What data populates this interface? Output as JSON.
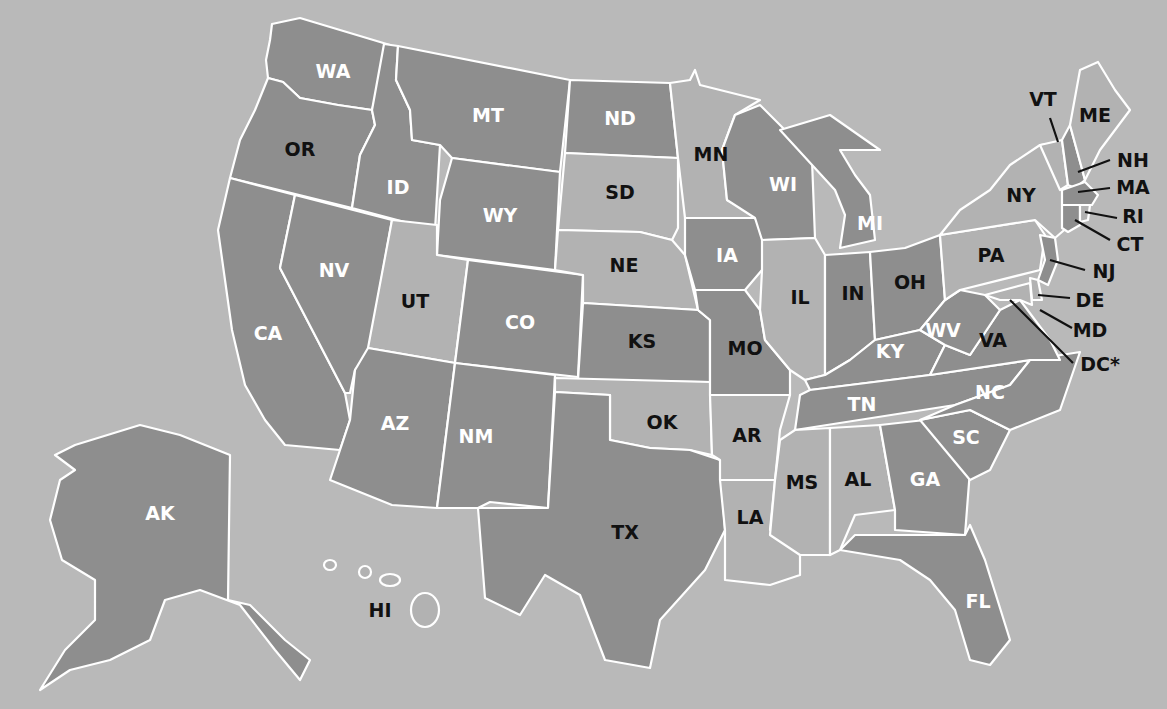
{
  "map": {
    "title": "United States state map",
    "colors": {
      "background": "#b9b9b9",
      "dark_fill": "#8e8e8e",
      "light_fill": "#b2b2b2",
      "border": "#ffffff",
      "label_dark": "#111111",
      "label_light": "#ffffff"
    },
    "states": [
      {
        "abbr": "WA",
        "shade": "dark",
        "label_color": "white"
      },
      {
        "abbr": "OR",
        "shade": "dark",
        "label_color": "black"
      },
      {
        "abbr": "CA",
        "shade": "dark",
        "label_color": "white"
      },
      {
        "abbr": "ID",
        "shade": "dark",
        "label_color": "white"
      },
      {
        "abbr": "NV",
        "shade": "dark",
        "label_color": "white"
      },
      {
        "abbr": "MT",
        "shade": "dark",
        "label_color": "white"
      },
      {
        "abbr": "WY",
        "shade": "dark",
        "label_color": "white"
      },
      {
        "abbr": "UT",
        "shade": "light",
        "label_color": "black"
      },
      {
        "abbr": "CO",
        "shade": "dark",
        "label_color": "white"
      },
      {
        "abbr": "AZ",
        "shade": "dark",
        "label_color": "white"
      },
      {
        "abbr": "NM",
        "shade": "dark",
        "label_color": "white"
      },
      {
        "abbr": "ND",
        "shade": "dark",
        "label_color": "white"
      },
      {
        "abbr": "SD",
        "shade": "light",
        "label_color": "black"
      },
      {
        "abbr": "NE",
        "shade": "light",
        "label_color": "black"
      },
      {
        "abbr": "KS",
        "shade": "dark",
        "label_color": "black"
      },
      {
        "abbr": "OK",
        "shade": "light",
        "label_color": "black"
      },
      {
        "abbr": "TX",
        "shade": "dark",
        "label_color": "black"
      },
      {
        "abbr": "MN",
        "shade": "light",
        "label_color": "black"
      },
      {
        "abbr": "IA",
        "shade": "dark",
        "label_color": "white"
      },
      {
        "abbr": "MO",
        "shade": "dark",
        "label_color": "black"
      },
      {
        "abbr": "AR",
        "shade": "light",
        "label_color": "black"
      },
      {
        "abbr": "LA",
        "shade": "light",
        "label_color": "black"
      },
      {
        "abbr": "WI",
        "shade": "dark",
        "label_color": "white"
      },
      {
        "abbr": "IL",
        "shade": "light",
        "label_color": "black"
      },
      {
        "abbr": "MI",
        "shade": "dark",
        "label_color": "white"
      },
      {
        "abbr": "IN",
        "shade": "dark",
        "label_color": "black"
      },
      {
        "abbr": "OH",
        "shade": "dark",
        "label_color": "black"
      },
      {
        "abbr": "KY",
        "shade": "dark",
        "label_color": "white"
      },
      {
        "abbr": "TN",
        "shade": "dark",
        "label_color": "white"
      },
      {
        "abbr": "MS",
        "shade": "light",
        "label_color": "black"
      },
      {
        "abbr": "AL",
        "shade": "light",
        "label_color": "black"
      },
      {
        "abbr": "GA",
        "shade": "dark",
        "label_color": "white"
      },
      {
        "abbr": "FL",
        "shade": "dark",
        "label_color": "white"
      },
      {
        "abbr": "SC",
        "shade": "dark",
        "label_color": "white"
      },
      {
        "abbr": "NC",
        "shade": "dark",
        "label_color": "white"
      },
      {
        "abbr": "VA",
        "shade": "dark",
        "label_color": "black"
      },
      {
        "abbr": "WV",
        "shade": "dark",
        "label_color": "white"
      },
      {
        "abbr": "PA",
        "shade": "light",
        "label_color": "black"
      },
      {
        "abbr": "NY",
        "shade": "light",
        "label_color": "black"
      },
      {
        "abbr": "VT",
        "shade": "light",
        "label_color": "black"
      },
      {
        "abbr": "ME",
        "shade": "light",
        "label_color": "black"
      },
      {
        "abbr": "NH",
        "shade": "dark",
        "label_color": "black"
      },
      {
        "abbr": "MA",
        "shade": "dark",
        "label_color": "black"
      },
      {
        "abbr": "RI",
        "shade": "light",
        "label_color": "black"
      },
      {
        "abbr": "CT",
        "shade": "dark",
        "label_color": "black"
      },
      {
        "abbr": "NJ",
        "shade": "dark",
        "label_color": "black"
      },
      {
        "abbr": "DE",
        "shade": "light",
        "label_color": "black"
      },
      {
        "abbr": "MD",
        "shade": "light",
        "label_color": "black"
      },
      {
        "abbr": "DC*",
        "shade": "light",
        "label_color": "black"
      },
      {
        "abbr": "AK",
        "shade": "dark",
        "label_color": "white"
      },
      {
        "abbr": "HI",
        "shade": "light",
        "label_color": "black"
      }
    ],
    "labels": {
      "WA": "WA",
      "OR": "OR",
      "CA": "CA",
      "ID": "ID",
      "NV": "NV",
      "MT": "MT",
      "WY": "WY",
      "UT": "UT",
      "CO": "CO",
      "AZ": "AZ",
      "NM": "NM",
      "ND": "ND",
      "SD": "SD",
      "NE": "NE",
      "KS": "KS",
      "OK": "OK",
      "TX": "TX",
      "MN": "MN",
      "IA": "IA",
      "MO": "MO",
      "AR": "AR",
      "LA": "LA",
      "WI": "WI",
      "IL": "IL",
      "MI": "MI",
      "IN": "IN",
      "OH": "OH",
      "KY": "KY",
      "TN": "TN",
      "MS": "MS",
      "AL": "AL",
      "GA": "GA",
      "FL": "FL",
      "SC": "SC",
      "NC": "NC",
      "VA": "VA",
      "WV": "WV",
      "PA": "PA",
      "NY": "NY",
      "VT": "VT",
      "ME": "ME",
      "NH": "NH",
      "MA": "MA",
      "RI": "RI",
      "CT": "CT",
      "NJ": "NJ",
      "DE": "DE",
      "MD": "MD",
      "DC": "DC*",
      "AK": "AK",
      "HI": "HI"
    }
  }
}
